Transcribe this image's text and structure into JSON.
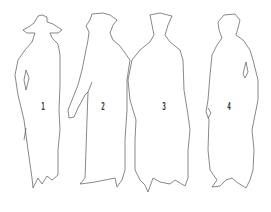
{
  "figures": [
    {
      "number": "1",
      "description": "figure with wide-brimmed hat"
    },
    {
      "number": "2",
      "description": "figure with small hat, arm extended"
    },
    {
      "number": "3",
      "description": "figure with tall collar"
    },
    {
      "number": "4",
      "description": "figure with short hair"
    }
  ],
  "colors": {
    "outline": "#555555",
    "background": "#ffffff"
  }
}
